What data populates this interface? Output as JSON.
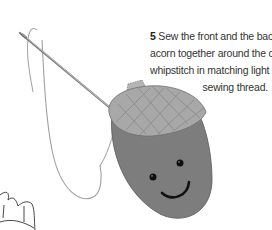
{
  "step": {
    "number": "5",
    "lines": [
      "Sew the front and the back of the",
      "acorn together around the cap using",
      "whipstitch in matching light brown",
      "sewing thread."
    ]
  },
  "illustration": {
    "subject": "felt acorn with smiling face being sewn with needle and thread",
    "colors": {
      "cap": "#a9a9a9",
      "cap_grid": "#8c8c8c",
      "body": "#7a7a7a",
      "face": "#111111",
      "thread": "#999999",
      "needle": "#888888",
      "outline": "#555555"
    }
  }
}
